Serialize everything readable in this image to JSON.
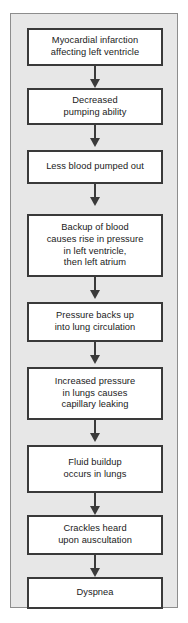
{
  "diagram": {
    "type": "flowchart",
    "orientation": "vertical",
    "colors": {
      "panel_background": "#e7e7e7",
      "panel_border": "#8d8d8d",
      "node_fill": "#ffffff",
      "node_border": "#3a3a3a",
      "connector": "#3a3a3a",
      "text": "#1a1a1a",
      "page_background": "#ffffff"
    },
    "nodes": [
      {
        "id": "node-1",
        "label": "Myocardial infarction\naffecting left ventricle"
      },
      {
        "id": "node-2",
        "label": "Decreased\npumping ability"
      },
      {
        "id": "node-3",
        "label": "Less blood pumped out"
      },
      {
        "id": "node-4",
        "label": "Backup of blood\ncauses rise in pressure\nin left ventricle,\nthen left atrium"
      },
      {
        "id": "node-5",
        "label": "Pressure backs up\ninto lung circulation"
      },
      {
        "id": "node-6",
        "label": "Increased pressure\nin lungs causes\ncapillary leaking"
      },
      {
        "id": "node-7",
        "label": "Fluid buildup\noccurs in lungs"
      },
      {
        "id": "node-8",
        "label": "Crackles heard\nupon auscultation"
      },
      {
        "id": "node-9",
        "label": "Dyspnea"
      }
    ],
    "connectors": [
      {
        "id": "arrow-1",
        "from": "node-1",
        "to": "node-2",
        "glyph": "down-arrow"
      },
      {
        "id": "arrow-2",
        "from": "node-2",
        "to": "node-3",
        "glyph": "down-arrow"
      },
      {
        "id": "arrow-3",
        "from": "node-3",
        "to": "node-4",
        "glyph": "down-arrow"
      },
      {
        "id": "arrow-4",
        "from": "node-4",
        "to": "node-5",
        "glyph": "down-arrow"
      },
      {
        "id": "arrow-5",
        "from": "node-5",
        "to": "node-6",
        "glyph": "down-arrow"
      },
      {
        "id": "arrow-6",
        "from": "node-6",
        "to": "node-7",
        "glyph": "down-arrow"
      },
      {
        "id": "arrow-7",
        "from": "node-7",
        "to": "node-8",
        "glyph": "down-arrow"
      },
      {
        "id": "arrow-8",
        "from": "node-8",
        "to": "node-9",
        "glyph": "down-arrow"
      }
    ]
  }
}
